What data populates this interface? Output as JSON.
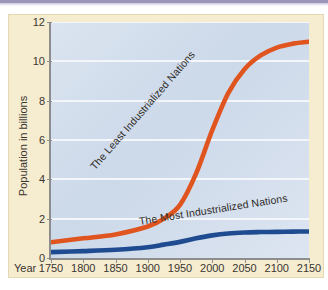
{
  "figure": {
    "background_color": "#f6ecd0",
    "plot_background_color": "#d4dfec",
    "top_rule_color": "#9a96b8"
  },
  "chart_data": {
    "type": "line",
    "title": "",
    "subtitle": "",
    "xlabel": "Year",
    "ylabel": "Population in billions",
    "xlim": [
      1750,
      2150
    ],
    "ylim": [
      0,
      12
    ],
    "grid": true,
    "grid_axis": "y",
    "legend_position": "inline-curve-labels",
    "x_ticks": [
      1750,
      1800,
      1850,
      1900,
      1950,
      2000,
      2050,
      2100,
      2150
    ],
    "x_tick_labels": [
      "1750",
      "1800",
      "1850",
      "1900",
      "1950",
      "2000",
      "2050",
      "2100",
      "2150"
    ],
    "y_ticks": [
      0,
      2,
      4,
      6,
      8,
      10,
      12
    ],
    "y_tick_labels": [
      "0",
      "2",
      "4",
      "6",
      "8",
      "10",
      "12"
    ],
    "x": [
      1750,
      1800,
      1850,
      1900,
      1925,
      1950,
      1975,
      2000,
      2025,
      2050,
      2075,
      2100,
      2125,
      2150
    ],
    "series": [
      {
        "name": "The Least Industrialized Nations",
        "color": "#e0551f",
        "values": [
          0.8,
          1.0,
          1.2,
          1.6,
          2.0,
          2.7,
          4.3,
          6.5,
          8.4,
          9.6,
          10.3,
          10.7,
          10.9,
          11.0
        ]
      },
      {
        "name": "The Most Industrialized Nations",
        "color": "#1f4c90",
        "values": [
          0.3,
          0.35,
          0.42,
          0.55,
          0.68,
          0.82,
          1.0,
          1.15,
          1.25,
          1.3,
          1.32,
          1.33,
          1.34,
          1.35
        ]
      }
    ],
    "annotations": [
      {
        "text": "The Least Industrialized Nations",
        "series": "The Least Industrialized Nations",
        "rotation_deg": -49
      },
      {
        "text": "The Most Industrialized Nations",
        "series": "The Most Industrialized Nations",
        "rotation_deg": -9
      }
    ]
  }
}
